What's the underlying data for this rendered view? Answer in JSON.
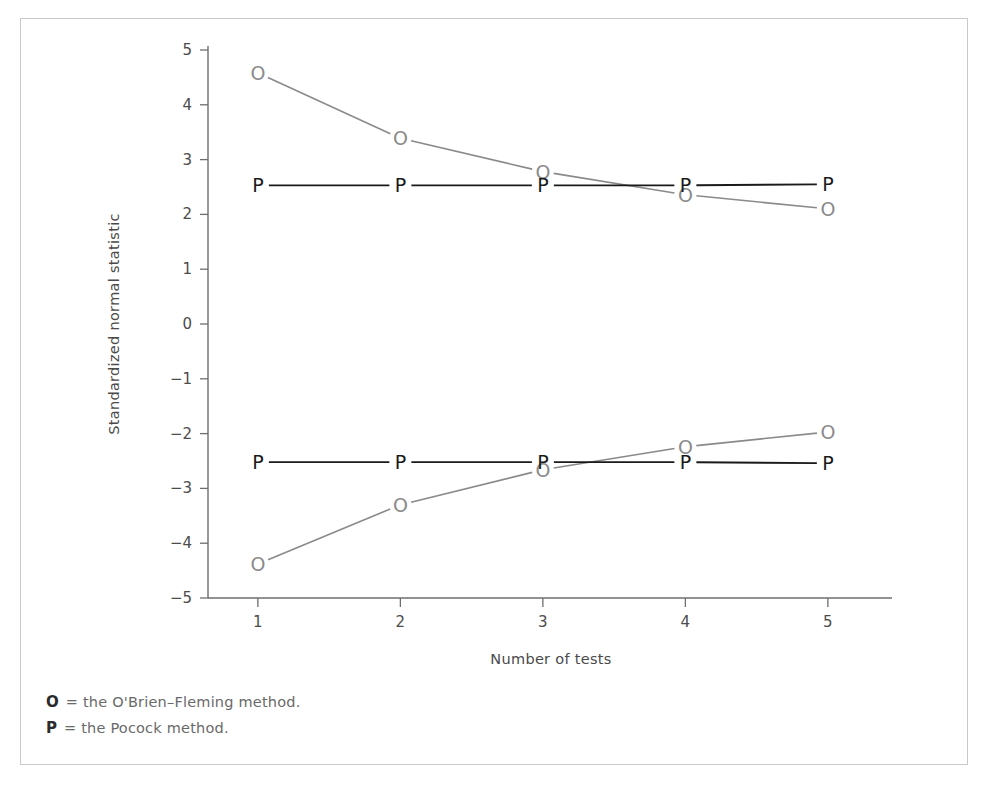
{
  "figure": {
    "border_color": "#c9c9c9",
    "background": "#ffffff"
  },
  "legend": {
    "rows": [
      {
        "key": "O",
        "text": "= the O'Brien–Fleming method."
      },
      {
        "key": "P",
        "text": "= the Pocock method."
      }
    ]
  },
  "chart_data": {
    "type": "line",
    "title": "",
    "xlabel": "Number of tests",
    "ylabel": "Standardized normal statistic",
    "x": [
      1,
      2,
      3,
      4,
      5
    ],
    "xticklabels": [
      "1",
      "2",
      "3",
      "4",
      "5"
    ],
    "yticks": [
      -5,
      -4,
      -3,
      -2,
      -1,
      0,
      1,
      2,
      3,
      4,
      5
    ],
    "yticklabels": [
      "5",
      "4",
      "3",
      "2",
      "1",
      "0",
      "-1",
      "-2",
      "-3",
      "-4",
      "-5"
    ],
    "xlim": [
      0.65,
      5.45
    ],
    "ylim": [
      -5,
      5
    ],
    "grid": false,
    "legend_position": "below-plot",
    "marker_colors": {
      "O": "#8a8a8a",
      "P": "#1a1a1a"
    },
    "series": [
      {
        "name": "O'Brien-Fleming upper",
        "marker": "O",
        "color": "#8a8a8a",
        "values": [
          4.58,
          3.39,
          2.78,
          2.36,
          2.1
        ]
      },
      {
        "name": "O'Brien-Fleming lower",
        "marker": "O",
        "color": "#8a8a8a",
        "values": [
          -4.38,
          -3.3,
          -2.66,
          -2.24,
          -1.97
        ]
      },
      {
        "name": "Pocock upper",
        "marker": "P",
        "color": "#1a1a1a",
        "values": [
          2.53,
          2.53,
          2.53,
          2.53,
          2.55
        ]
      },
      {
        "name": "Pocock lower",
        "marker": "P",
        "color": "#1a1a1a",
        "values": [
          -2.52,
          -2.52,
          -2.52,
          -2.52,
          -2.54
        ]
      }
    ]
  }
}
